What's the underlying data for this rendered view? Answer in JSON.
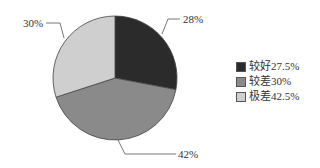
{
  "chart_data": {
    "type": "pie",
    "title": "",
    "slices": [
      {
        "label": "较好27.5%",
        "category": "较好",
        "value": 28,
        "display": "28%",
        "color": "#2b2b2b"
      },
      {
        "label": "较差30%",
        "category": "较差",
        "value": 42,
        "display": "42%",
        "color": "#8a8a8a"
      },
      {
        "label": "极差42.5%",
        "category": "极差",
        "value": 30,
        "display": "30%",
        "color": "#cfcfcf"
      }
    ],
    "legend": [
      "较好27.5%",
      "较差30%",
      "极差42.5%"
    ],
    "legend_position": "right"
  },
  "labels": {
    "s0": "28%",
    "s1": "42%",
    "s2": "30%"
  },
  "legend": {
    "item0": "较好27.5%",
    "item1": "较差30%",
    "item2": "极差42.5%"
  }
}
